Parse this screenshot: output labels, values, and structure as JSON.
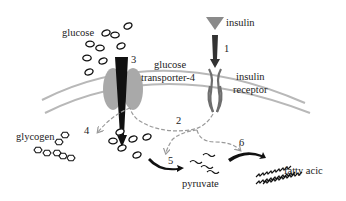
{
  "labels": {
    "glucose": "glucose",
    "transporter_line1": "glucose",
    "transporter_line2": "transporter-4",
    "insulin": "insulin",
    "receptor_line1": "insulin",
    "receptor_line2": "receptor",
    "glycogen": "glycogen",
    "pyruvate": "pyruvate",
    "fatty_acid": "fatty acic"
  },
  "steps": [
    "1",
    "2",
    "3",
    "4",
    "5",
    "6"
  ],
  "colors": {
    "membrane": "#b8b8b8",
    "transporter": "#a9a9a9",
    "insulin": "#8a8a8a",
    "arrow_dark": "#111111",
    "arrow_dashed": "#9a9a9a",
    "receptor": "#6e6e6e",
    "text": "#222222"
  }
}
